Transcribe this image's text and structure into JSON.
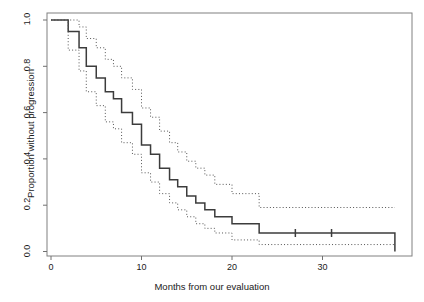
{
  "chart_data": {
    "type": "line",
    "subtype": "kaplan-meier-survival",
    "title": "",
    "xlabel": "Months from our evaluation",
    "ylabel": "Proportion without progression",
    "xlim": [
      0,
      40
    ],
    "ylim": [
      0.0,
      1.0
    ],
    "xticks": [
      0,
      10,
      20,
      30
    ],
    "xtick_labels": [
      "0",
      "10",
      "20",
      "30"
    ],
    "yticks": [
      0.0,
      0.2,
      0.4,
      0.6,
      0.8,
      1.0
    ],
    "ytick_labels": [
      "0.0",
      "0.2",
      "0.4",
      "0.6",
      "0.8",
      "1.0"
    ],
    "grid": false,
    "legend": null,
    "series": [
      {
        "name": "Survival estimate",
        "style": "solid step",
        "color": "#3c3c3c",
        "step_points": [
          {
            "x": 0.0,
            "y": 1.0
          },
          {
            "x": 1.9,
            "y": 0.95
          },
          {
            "x": 3.1,
            "y": 0.88
          },
          {
            "x": 3.9,
            "y": 0.8
          },
          {
            "x": 5.0,
            "y": 0.75
          },
          {
            "x": 6.0,
            "y": 0.69
          },
          {
            "x": 6.9,
            "y": 0.66
          },
          {
            "x": 7.8,
            "y": 0.6
          },
          {
            "x": 9.0,
            "y": 0.55
          },
          {
            "x": 10.0,
            "y": 0.46
          },
          {
            "x": 11.0,
            "y": 0.42
          },
          {
            "x": 12.0,
            "y": 0.36
          },
          {
            "x": 13.1,
            "y": 0.31
          },
          {
            "x": 14.0,
            "y": 0.28
          },
          {
            "x": 15.0,
            "y": 0.24
          },
          {
            "x": 16.0,
            "y": 0.21
          },
          {
            "x": 17.0,
            "y": 0.18
          },
          {
            "x": 18.1,
            "y": 0.15
          },
          {
            "x": 20.0,
            "y": 0.12
          },
          {
            "x": 23.0,
            "y": 0.08
          },
          {
            "x": 38.0,
            "y": 0.08
          },
          {
            "x": 38.0,
            "y": 0.0
          }
        ],
        "censor_marks": [
          {
            "x": 27.0,
            "y": 0.08
          },
          {
            "x": 31.0,
            "y": 0.08
          }
        ]
      },
      {
        "name": "Upper 95% confidence limit",
        "style": "dotted step",
        "color": "#555555",
        "step_points": [
          {
            "x": 0.0,
            "y": 1.0
          },
          {
            "x": 1.9,
            "y": 1.0
          },
          {
            "x": 3.1,
            "y": 0.97
          },
          {
            "x": 3.9,
            "y": 0.92
          },
          {
            "x": 5.0,
            "y": 0.88
          },
          {
            "x": 6.0,
            "y": 0.83
          },
          {
            "x": 6.9,
            "y": 0.8
          },
          {
            "x": 7.8,
            "y": 0.75
          },
          {
            "x": 9.0,
            "y": 0.7
          },
          {
            "x": 10.0,
            "y": 0.62
          },
          {
            "x": 11.0,
            "y": 0.58
          },
          {
            "x": 12.0,
            "y": 0.52
          },
          {
            "x": 13.1,
            "y": 0.47
          },
          {
            "x": 14.0,
            "y": 0.43
          },
          {
            "x": 15.0,
            "y": 0.39
          },
          {
            "x": 16.0,
            "y": 0.36
          },
          {
            "x": 17.0,
            "y": 0.33
          },
          {
            "x": 18.1,
            "y": 0.29
          },
          {
            "x": 20.0,
            "y": 0.25
          },
          {
            "x": 23.0,
            "y": 0.19
          },
          {
            "x": 38.0,
            "y": 0.19
          }
        ]
      },
      {
        "name": "Lower 95% confidence limit",
        "style": "dotted step",
        "color": "#555555",
        "step_points": [
          {
            "x": 0.0,
            "y": 1.0
          },
          {
            "x": 1.9,
            "y": 0.87
          },
          {
            "x": 3.1,
            "y": 0.78
          },
          {
            "x": 3.9,
            "y": 0.69
          },
          {
            "x": 5.0,
            "y": 0.63
          },
          {
            "x": 6.0,
            "y": 0.56
          },
          {
            "x": 6.9,
            "y": 0.53
          },
          {
            "x": 7.8,
            "y": 0.47
          },
          {
            "x": 9.0,
            "y": 0.42
          },
          {
            "x": 10.0,
            "y": 0.34
          },
          {
            "x": 11.0,
            "y": 0.3
          },
          {
            "x": 12.0,
            "y": 0.25
          },
          {
            "x": 13.1,
            "y": 0.21
          },
          {
            "x": 14.0,
            "y": 0.18
          },
          {
            "x": 15.0,
            "y": 0.15
          },
          {
            "x": 16.0,
            "y": 0.12
          },
          {
            "x": 17.0,
            "y": 0.1
          },
          {
            "x": 18.1,
            "y": 0.08
          },
          {
            "x": 20.0,
            "y": 0.05
          },
          {
            "x": 23.0,
            "y": 0.03
          },
          {
            "x": 38.0,
            "y": 0.03
          }
        ]
      }
    ]
  }
}
